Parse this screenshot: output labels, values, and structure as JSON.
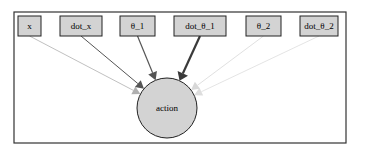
{
  "diagram": {
    "type": "directed-graph",
    "frame": {
      "x": 14,
      "y": 12,
      "width": 332,
      "height": 131,
      "stroke": "#333333"
    },
    "source_nodes": [
      {
        "id": "x",
        "label": "x",
        "x": 18,
        "y": 16,
        "w": 23,
        "h": 20
      },
      {
        "id": "dot_x",
        "label": "dot_x",
        "x": 60,
        "y": 16,
        "w": 42,
        "h": 20
      },
      {
        "id": "theta_1",
        "label": "θ_1",
        "x": 120,
        "y": 16,
        "w": 35,
        "h": 20
      },
      {
        "id": "dot_theta_1",
        "label": "dot_θ_1",
        "x": 174,
        "y": 16,
        "w": 52,
        "h": 20
      },
      {
        "id": "theta_2",
        "label": "θ_2",
        "x": 246,
        "y": 16,
        "w": 35,
        "h": 20
      },
      {
        "id": "dot_theta_2",
        "label": "dot_θ_2",
        "x": 300,
        "y": 16,
        "w": 38,
        "h": 20
      }
    ],
    "target_node": {
      "id": "action",
      "label": "action",
      "cx": 167,
      "cy": 108,
      "r": 30
    },
    "edges": [
      {
        "from": "x",
        "to": "action",
        "color": "#b0b0b0",
        "width": 0.8
      },
      {
        "from": "dot_x",
        "to": "action",
        "color": "#555555",
        "width": 1.0
      },
      {
        "from": "theta_1",
        "to": "action",
        "color": "#555555",
        "width": 1.2
      },
      {
        "from": "dot_theta_1",
        "to": "action",
        "color": "#3a3a3a",
        "width": 2.2
      },
      {
        "from": "theta_2",
        "to": "action",
        "color": "#d8d8d8",
        "width": 0.8
      },
      {
        "from": "dot_theta_2",
        "to": "action",
        "color": "#dddddd",
        "width": 0.8
      }
    ],
    "colors": {
      "node_fill": "#d3d3d3",
      "node_stroke": "#222222",
      "background": "#ffffff"
    }
  }
}
